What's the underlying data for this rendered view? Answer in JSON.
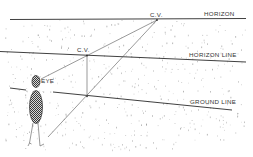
{
  "diagram": {
    "labels": {
      "horizon": "HORIZON",
      "horizon_line": "HORIZON LINE",
      "ground_line": "GROUND LINE",
      "cv_far": "C.V.",
      "cv_near": "C.V.",
      "eye": "EYE"
    },
    "elements": [
      {
        "id": "horizon",
        "type": "line",
        "label": "HORIZON"
      },
      {
        "id": "horizon-line",
        "type": "line",
        "label": "HORIZON LINE"
      },
      {
        "id": "ground-line",
        "type": "line",
        "label": "GROUND LINE"
      },
      {
        "id": "cv-far",
        "type": "point",
        "label": "C.V."
      },
      {
        "id": "cv-near",
        "type": "point",
        "label": "C.V."
      },
      {
        "id": "observer",
        "type": "figure",
        "label": "EYE"
      }
    ],
    "colors": {
      "ink": "#2a2a2a",
      "stipple": "#8a8a8a",
      "background": "#ffffff"
    }
  }
}
